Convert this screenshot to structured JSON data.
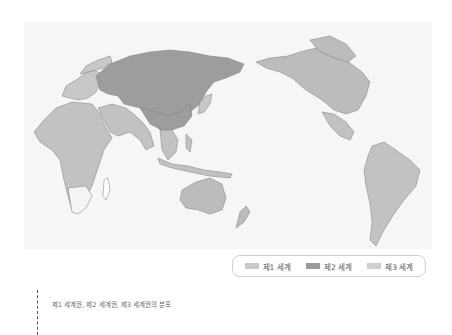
{
  "map": {
    "title": "",
    "colors": {
      "first_world": "#bcbcbc",
      "second_world": "#9d9d9d",
      "third_world": "#c2c2c2",
      "ocean": "#f6f6f6",
      "border": "#8a8a8a"
    }
  },
  "legend": {
    "items": [
      {
        "label": "제1 세계",
        "color": "#c8c8c8"
      },
      {
        "label": "제2 세계",
        "color": "#9a9a9a"
      },
      {
        "label": "제3 세계",
        "color": "#cfcfcf"
      }
    ]
  },
  "caption": {
    "text": "제1 세계권, 제2 세계권, 제3 세계권의 분포"
  }
}
